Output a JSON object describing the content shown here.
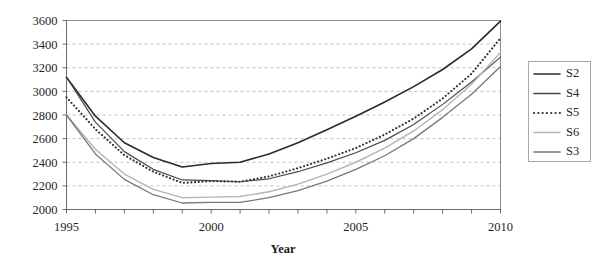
{
  "chart_data": {
    "type": "line",
    "title": "",
    "xlabel": "Year",
    "ylabel": "",
    "xlim": [
      1995,
      2010
    ],
    "ylim": [
      2000,
      3600
    ],
    "ytick_step": 200,
    "grid": true,
    "legend_position": "right",
    "x": [
      1995,
      1996,
      1997,
      1998,
      1999,
      2000,
      2001,
      2002,
      2003,
      2004,
      2005,
      2006,
      2007,
      2008,
      2009,
      2010
    ],
    "x_tick_labels": [
      "1995",
      "2000",
      "2005",
      "2010"
    ],
    "x_tick_label_values": [
      1995,
      2000,
      2005,
      2010
    ],
    "y_tick_labels": [
      "2000",
      "2200",
      "2400",
      "2600",
      "2800",
      "3000",
      "3200",
      "3400",
      "3600"
    ],
    "y_tick_values": [
      2000,
      2200,
      2400,
      2600,
      2800,
      3000,
      3200,
      3400,
      3600
    ],
    "series": [
      {
        "name": "S2",
        "color": "#2b2b2b",
        "width": 1.6,
        "dash": "none",
        "values": [
          3120,
          2790,
          2565,
          2440,
          2360,
          2390,
          2400,
          2470,
          2565,
          2675,
          2790,
          2910,
          3040,
          3185,
          3360,
          3595
        ]
      },
      {
        "name": "S4",
        "color": "#4a4a4a",
        "width": 1.2,
        "dash": "none",
        "values": [
          3120,
          2740,
          2490,
          2340,
          2250,
          2245,
          2235,
          2260,
          2320,
          2395,
          2480,
          2585,
          2720,
          2890,
          3080,
          3290
        ]
      },
      {
        "name": "S5",
        "color": "#333333",
        "width": 1.6,
        "dash": "dotted",
        "values": [
          2950,
          2680,
          2460,
          2320,
          2225,
          2240,
          2235,
          2280,
          2350,
          2430,
          2520,
          2635,
          2770,
          2940,
          3150,
          3450
        ]
      },
      {
        "name": "S6",
        "color": "#b5b5b5",
        "width": 1.4,
        "dash": "none",
        "values": [
          2800,
          2510,
          2300,
          2170,
          2100,
          2105,
          2110,
          2150,
          2215,
          2300,
          2400,
          2520,
          2665,
          2845,
          3060,
          3330
        ]
      },
      {
        "name": "S3",
        "color": "#787878",
        "width": 1.3,
        "dash": "none",
        "values": [
          2800,
          2470,
          2255,
          2125,
          2055,
          2060,
          2060,
          2100,
          2160,
          2240,
          2340,
          2455,
          2600,
          2780,
          2975,
          3210
        ]
      }
    ]
  },
  "legend": {
    "entries": [
      {
        "label": "S2"
      },
      {
        "label": "S4"
      },
      {
        "label": "S5"
      },
      {
        "label": "S6"
      },
      {
        "label": "S3"
      }
    ]
  },
  "axis": {
    "x_title": "Year"
  }
}
